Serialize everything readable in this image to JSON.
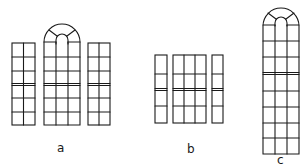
{
  "figure": {
    "stroke_color": "#1a1a1a",
    "background": "#ffffff"
  },
  "labels": {
    "a": "a",
    "b": "b",
    "c": "c"
  },
  "groups": [
    {
      "id": "a",
      "windows": [
        {
          "name": "left-sidelight",
          "x": 12,
          "y": 43,
          "w": 23,
          "h": 82,
          "cols": 2,
          "rows": [
            57,
            71,
            98,
            112
          ],
          "transom": 84,
          "arched": false
        },
        {
          "name": "center-arched",
          "x": 44,
          "y": 42,
          "w": 36,
          "h": 83,
          "cols": 3,
          "rows": [
            57,
            71,
            98,
            112
          ],
          "transom": 84,
          "arched": true,
          "arch_top": 24
        },
        {
          "name": "right-sidelight",
          "x": 88,
          "y": 43,
          "w": 22,
          "h": 82,
          "cols": 2,
          "rows": [
            57,
            71,
            98,
            112
          ],
          "transom": 84,
          "arched": false
        }
      ]
    },
    {
      "id": "b",
      "windows": [
        {
          "name": "left-sidelight",
          "x": 155,
          "y": 55,
          "w": 12,
          "h": 68,
          "cols": 1,
          "rows": [
            74,
            106
          ],
          "transom": 89,
          "arched": false
        },
        {
          "name": "center",
          "x": 173,
          "y": 55,
          "w": 33,
          "h": 68,
          "cols": 3,
          "rows": [
            74,
            106
          ],
          "transom": 89,
          "arched": false
        },
        {
          "name": "right-sidelight",
          "x": 212,
          "y": 55,
          "w": 11,
          "h": 68,
          "cols": 1,
          "rows": [
            74,
            106
          ],
          "transom": 89,
          "arched": false
        }
      ]
    },
    {
      "id": "c",
      "windows": [
        {
          "name": "tall-arched",
          "x": 263,
          "y": 25,
          "w": 36,
          "h": 129,
          "cols": 3,
          "rows": [
            41,
            57,
            91,
            107,
            123,
            138
          ],
          "transom": 73,
          "arched": true,
          "arch_top": 8
        }
      ]
    }
  ]
}
